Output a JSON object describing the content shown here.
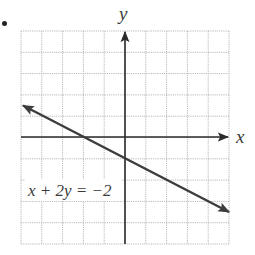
{
  "figure": {
    "bullet": "•",
    "x_axis_label": "x",
    "y_axis_label": "y",
    "equation_label": "x + 2y = −2"
  },
  "colors": {
    "grid": "#b8b8b8",
    "axis": "#2a2a2a",
    "line": "#3c3c3c",
    "text": "#3a3a3a",
    "background": "#ffffff"
  },
  "chart_data": {
    "type": "line",
    "title": "",
    "xlabel": "x",
    "ylabel": "y",
    "xlim": [
      -5,
      5
    ],
    "ylim": [
      -5,
      5
    ],
    "grid": true,
    "grid_step": 1,
    "legend": null,
    "series": [
      {
        "name": "x + 2y = −2",
        "equation": "x + 2y = -2",
        "slope": -0.5,
        "y_intercept": -1,
        "x_intercept": -2,
        "x": [
          -5,
          -2,
          0,
          5
        ],
        "y": [
          1.5,
          0,
          -1,
          -3.5
        ],
        "arrows_both_ends": true
      }
    ],
    "annotations": [
      {
        "text": "x + 2y = −2",
        "x": -4.5,
        "y": -2.5
      }
    ]
  }
}
